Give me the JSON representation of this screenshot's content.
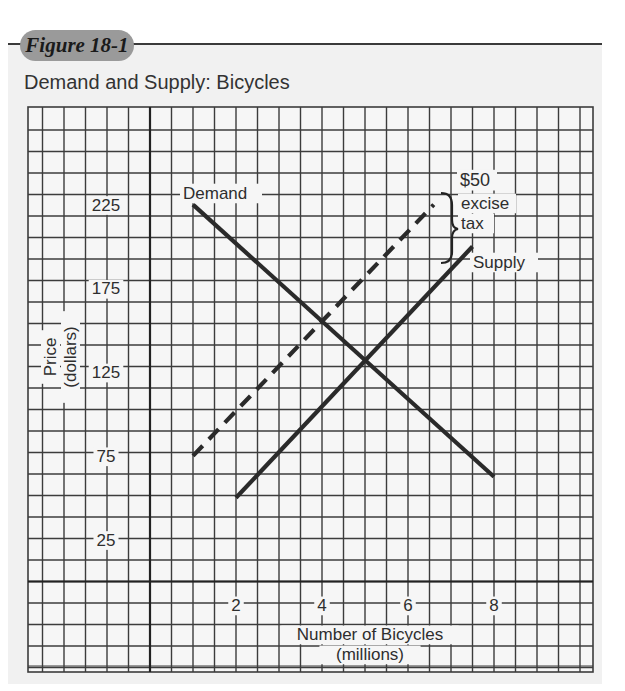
{
  "figure": {
    "label": "Figure 18-1",
    "title": "Demand and Supply: Bicycles"
  },
  "colors": {
    "grid": "#3c3c3c",
    "line": "#2a2a2a",
    "panel": "#f1f1f1",
    "badge": "#9a9a9a"
  },
  "chart_data": {
    "type": "line",
    "title": "Demand and Supply: Bicycles",
    "xlabel": "Number of Bicycles (millions)",
    "ylabel": "Price (dollars)",
    "x_ticks": [
      2,
      4,
      6,
      8
    ],
    "y_ticks": [
      25,
      75,
      125,
      175,
      225
    ],
    "xlim": [
      0,
      10
    ],
    "ylim": [
      0,
      225
    ],
    "grid": true,
    "series": [
      {
        "name": "Demand",
        "style": "solid",
        "points": [
          [
            1,
            225
          ],
          [
            8,
            62.5
          ]
        ]
      },
      {
        "name": "Supply",
        "style": "solid",
        "points": [
          [
            2,
            50
          ],
          [
            7.5,
            200
          ]
        ]
      },
      {
        "name": "Supply + $50 excise tax",
        "style": "dashed",
        "points": [
          [
            1,
            75
          ],
          [
            6.6,
            225
          ]
        ]
      }
    ],
    "annotations": [
      {
        "text": "Demand",
        "x": 1,
        "y": 225
      },
      {
        "text": "Supply",
        "x": 7.5,
        "y": 200
      },
      {
        "text": "$50 excise tax",
        "type": "brace",
        "x": 7.0,
        "y_from": 200,
        "y_to": 240
      }
    ],
    "equilibrium": {
      "before_tax": {
        "quantity": 5,
        "price": 132.5
      },
      "after_tax": {
        "quantity": 4,
        "price": 155
      }
    }
  },
  "labels": {
    "ylabel_line1": "Price",
    "ylabel_line2": "(dollars)",
    "xlabel_line1": "Number of Bicycles",
    "xlabel_line2": "(millions)",
    "demand": "Demand",
    "supply": "Supply",
    "tax_line1": "$50",
    "tax_line2": "excise",
    "tax_line3": "tax"
  }
}
